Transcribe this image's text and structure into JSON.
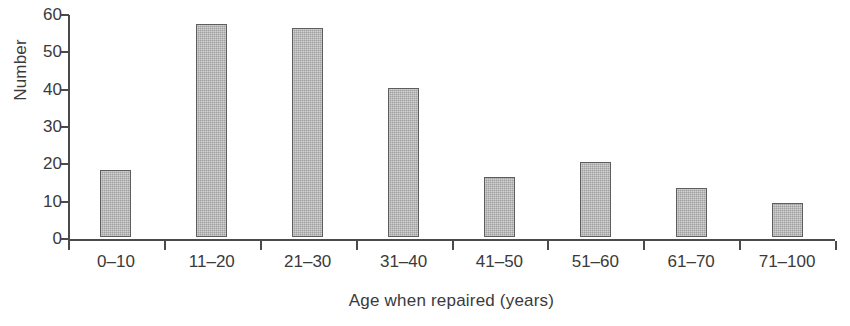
{
  "chart_data": {
    "type": "bar",
    "title": "",
    "xlabel": "Age when repaired (years)",
    "ylabel": "Number",
    "categories": [
      "0–10",
      "11–20",
      "21–30",
      "31–40",
      "41–50",
      "51–60",
      "61–70",
      "71–100"
    ],
    "values": [
      18,
      57,
      56,
      40,
      16,
      20,
      13,
      9
    ],
    "ylim": [
      0,
      60
    ],
    "yticks": [
      0,
      10,
      20,
      30,
      40,
      50,
      60
    ],
    "ytick_labels": [
      "0",
      "10",
      "20",
      "30",
      "40",
      "50",
      "60"
    ],
    "grid": false,
    "legend": false,
    "bar_color": "#b5b5b5",
    "bar_border_color": "#5e5e5e",
    "axis_color": "#4a4a4a",
    "text_color": "#3a3a3a",
    "background_color": "#ffffff"
  }
}
